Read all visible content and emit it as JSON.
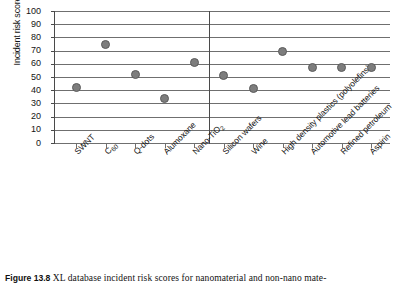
{
  "figure": {
    "number_label": "Figure 13.8",
    "caption_text": "XL database incident risk scores for nanomaterial and non-nano mate-"
  },
  "chart_data": {
    "type": "scatter",
    "title": "",
    "xlabel": "",
    "ylabel": "Incident risk score",
    "ylim": [
      0,
      100
    ],
    "ytick_values": [
      0,
      10,
      20,
      30,
      40,
      50,
      60,
      70,
      80,
      90,
      100
    ],
    "ytick_labels": [
      "0",
      "10",
      "20",
      "30",
      "40",
      "50",
      "60",
      "70",
      "80",
      "90",
      "100"
    ],
    "grid": true,
    "legend": "none",
    "divider_after_category": "Nano-TiO2",
    "divider_note": "vertical rule separating nanomaterials (left) from non-nano materials (right)",
    "categories": [
      "SWNT",
      "C60",
      "Q-dots",
      "Alumoxane",
      "Nano-TiO2",
      "Silicon wafers",
      "Wine",
      "High density plastics (polyolefins)",
      "Automotive lead batteries",
      "Refined petroleum",
      "Aspirin"
    ],
    "category_labels_html": [
      "SWNT",
      "C<sub>60</sub>",
      "Q-dots",
      "Alumoxane",
      "Nano-TiO<sub>2</sub>",
      "Silicon wafers",
      "Wine",
      "High density plastics (polyolefins)",
      "Automotive lead batteries",
      "Refined petroleum",
      "Aspirin"
    ],
    "values": [
      42,
      75,
      52,
      34,
      61,
      51,
      41,
      69,
      57,
      57,
      57
    ],
    "marker": {
      "shape": "circle",
      "fill_color": "#7d7d7d",
      "edge_color": "#5b5b5b"
    },
    "axis_color": "#4a4a4a",
    "grid_color": "#6f6f6f"
  }
}
